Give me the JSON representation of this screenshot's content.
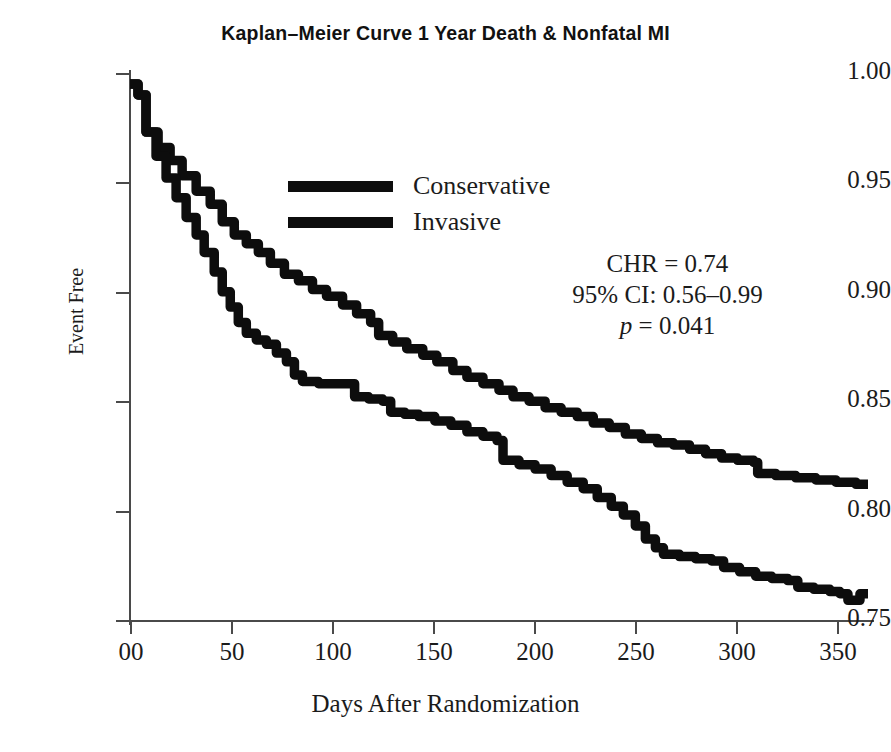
{
  "chart_data": {
    "type": "line",
    "title": "Kaplan–Meier Curve 1 Year Death & Nonfatal MI",
    "xlabel": "Days After Randomization",
    "ylabel": "Event Free",
    "xlim": [
      0,
      370
    ],
    "ylim": [
      0.75,
      1.0
    ],
    "xticks": [
      0,
      50,
      100,
      150,
      200,
      250,
      300,
      350
    ],
    "xtick_labels": [
      "00",
      "50",
      "100",
      "150",
      "200",
      "250",
      "300",
      "350"
    ],
    "yticks": [
      0.75,
      0.8,
      0.85,
      0.9,
      0.95,
      1.0
    ],
    "ytick_labels": [
      "0.75",
      "0.80",
      "0.85",
      "0.90",
      "0.95",
      "1.00"
    ],
    "grid": false,
    "legend_position": "upper center",
    "series": [
      {
        "name": "Conservative",
        "color": "#0d0d0d",
        "points": [
          [
            0,
            0.995
          ],
          [
            4,
            0.99
          ],
          [
            8,
            0.973
          ],
          [
            14,
            0.966
          ],
          [
            20,
            0.96
          ],
          [
            26,
            0.953
          ],
          [
            33,
            0.946
          ],
          [
            40,
            0.94
          ],
          [
            46,
            0.932
          ],
          [
            52,
            0.926
          ],
          [
            58,
            0.922
          ],
          [
            64,
            0.918
          ],
          [
            70,
            0.913
          ],
          [
            77,
            0.908
          ],
          [
            84,
            0.905
          ],
          [
            91,
            0.901
          ],
          [
            98,
            0.898
          ],
          [
            106,
            0.894
          ],
          [
            113,
            0.89
          ],
          [
            120,
            0.886
          ],
          [
            124,
            0.88
          ],
          [
            131,
            0.877
          ],
          [
            138,
            0.874
          ],
          [
            146,
            0.871
          ],
          [
            153,
            0.868
          ],
          [
            161,
            0.864
          ],
          [
            168,
            0.861
          ],
          [
            176,
            0.858
          ],
          [
            184,
            0.855
          ],
          [
            191,
            0.852
          ],
          [
            199,
            0.85
          ],
          [
            207,
            0.847
          ],
          [
            215,
            0.845
          ],
          [
            223,
            0.843
          ],
          [
            231,
            0.84
          ],
          [
            239,
            0.838
          ],
          [
            247,
            0.835
          ],
          [
            255,
            0.833
          ],
          [
            263,
            0.831
          ],
          [
            271,
            0.83
          ],
          [
            279,
            0.828
          ],
          [
            287,
            0.826
          ],
          [
            295,
            0.824
          ],
          [
            303,
            0.823
          ],
          [
            311,
            0.822
          ],
          [
            313,
            0.817
          ],
          [
            322,
            0.816
          ],
          [
            332,
            0.815
          ],
          [
            342,
            0.814
          ],
          [
            352,
            0.813
          ],
          [
            362,
            0.812
          ],
          [
            368,
            0.812
          ]
        ]
      },
      {
        "name": "Invasive",
        "color": "#0d0d0d",
        "points": [
          [
            0,
            0.995
          ],
          [
            4,
            0.99
          ],
          [
            8,
            0.973
          ],
          [
            13,
            0.962
          ],
          [
            18,
            0.952
          ],
          [
            23,
            0.943
          ],
          [
            28,
            0.934
          ],
          [
            33,
            0.926
          ],
          [
            37,
            0.918
          ],
          [
            42,
            0.909
          ],
          [
            46,
            0.9
          ],
          [
            50,
            0.893
          ],
          [
            54,
            0.886
          ],
          [
            58,
            0.881
          ],
          [
            63,
            0.878
          ],
          [
            68,
            0.876
          ],
          [
            73,
            0.872
          ],
          [
            78,
            0.868
          ],
          [
            82,
            0.862
          ],
          [
            86,
            0.859
          ],
          [
            94,
            0.858
          ],
          [
            102,
            0.858
          ],
          [
            108,
            0.858
          ],
          [
            112,
            0.852
          ],
          [
            119,
            0.851
          ],
          [
            126,
            0.85
          ],
          [
            130,
            0.845
          ],
          [
            137,
            0.844
          ],
          [
            144,
            0.843
          ],
          [
            152,
            0.841
          ],
          [
            160,
            0.839
          ],
          [
            168,
            0.836
          ],
          [
            176,
            0.834
          ],
          [
            183,
            0.832
          ],
          [
            186,
            0.823
          ],
          [
            194,
            0.821
          ],
          [
            202,
            0.819
          ],
          [
            210,
            0.816
          ],
          [
            218,
            0.813
          ],
          [
            226,
            0.81
          ],
          [
            233,
            0.806
          ],
          [
            240,
            0.802
          ],
          [
            246,
            0.798
          ],
          [
            252,
            0.793
          ],
          [
            257,
            0.787
          ],
          [
            262,
            0.783
          ],
          [
            266,
            0.78
          ],
          [
            274,
            0.779
          ],
          [
            282,
            0.778
          ],
          [
            290,
            0.777
          ],
          [
            296,
            0.774
          ],
          [
            304,
            0.772
          ],
          [
            312,
            0.77
          ],
          [
            320,
            0.769
          ],
          [
            328,
            0.768
          ],
          [
            333,
            0.765
          ],
          [
            341,
            0.764
          ],
          [
            349,
            0.763
          ],
          [
            354,
            0.762
          ],
          [
            358,
            0.759
          ],
          [
            364,
            0.762
          ],
          [
            368,
            0.762
          ]
        ]
      }
    ],
    "annotations": {
      "chr": "CHR = 0.74",
      "ci": "95% CI: 0.56–0.99",
      "pvalue_italic": "p",
      "pvalue_rest": " = 0.041"
    }
  }
}
